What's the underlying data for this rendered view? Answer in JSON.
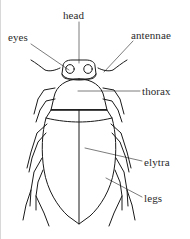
{
  "figure": {
    "view": "dorsal",
    "line_color": "#1a1a1a",
    "background_color": "#ffffff",
    "text_color": "#2b2b2b"
  },
  "labels": [
    {
      "id": "head",
      "text": "head"
    },
    {
      "id": "eyes",
      "text": "eyes"
    },
    {
      "id": "antennae",
      "text": "antennae"
    },
    {
      "id": "thorax",
      "text": "thorax"
    },
    {
      "id": "elytra",
      "text": "elytra"
    },
    {
      "id": "legs",
      "text": "legs"
    }
  ],
  "parts": {
    "head": "head",
    "eyes": "eyes",
    "antennae": "antennae",
    "thorax": "thorax",
    "elytra": "elytra",
    "legs": "legs"
  }
}
